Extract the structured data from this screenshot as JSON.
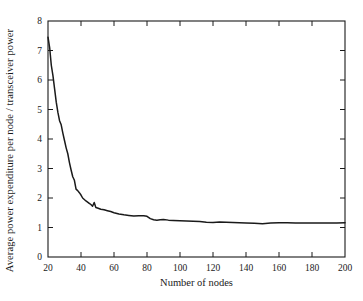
{
  "chart_data": {
    "type": "line",
    "title": "",
    "xlabel": "Number of nodes",
    "ylabel": "Average power expenditure per node / transceiver power",
    "xlim": [
      20,
      200
    ],
    "ylim": [
      0,
      8
    ],
    "xticks": [
      20,
      40,
      60,
      80,
      100,
      120,
      140,
      160,
      180,
      200
    ],
    "yticks": [
      0,
      1,
      2,
      3,
      4,
      5,
      6,
      7,
      8
    ],
    "grid": false,
    "legend": null,
    "frame": "box-all-sides-inward-ticks",
    "line_color": "#1a1a1a",
    "series": [
      {
        "name": "average power expenditure ratio",
        "x": [
          20,
          21,
          22,
          23,
          24,
          25,
          26,
          27,
          28,
          29,
          30,
          31,
          32,
          33,
          34,
          35,
          36,
          37,
          38,
          39,
          40,
          41,
          42,
          43,
          44,
          45,
          46,
          47,
          48,
          49,
          50,
          52,
          54,
          56,
          58,
          60,
          63,
          66,
          69,
          72,
          75,
          78,
          80,
          82,
          84,
          86,
          88,
          90,
          93,
          96,
          100,
          104,
          108,
          112,
          116,
          120,
          124,
          128,
          132,
          136,
          140,
          145,
          150,
          155,
          160,
          165,
          170,
          175,
          180,
          185,
          190,
          195,
          200
        ],
        "values": [
          7.45,
          7.1,
          6.5,
          6.15,
          5.7,
          5.25,
          4.9,
          4.62,
          4.48,
          4.2,
          3.95,
          3.7,
          3.5,
          3.2,
          2.95,
          2.72,
          2.6,
          2.3,
          2.25,
          2.18,
          2.1,
          2.0,
          1.95,
          1.9,
          1.86,
          1.82,
          1.78,
          1.72,
          1.85,
          1.68,
          1.66,
          1.62,
          1.6,
          1.57,
          1.54,
          1.5,
          1.46,
          1.43,
          1.41,
          1.39,
          1.4,
          1.4,
          1.38,
          1.3,
          1.26,
          1.25,
          1.26,
          1.27,
          1.25,
          1.24,
          1.23,
          1.22,
          1.21,
          1.2,
          1.18,
          1.17,
          1.19,
          1.18,
          1.17,
          1.16,
          1.15,
          1.14,
          1.13,
          1.15,
          1.16,
          1.16,
          1.15,
          1.15,
          1.15,
          1.15,
          1.15,
          1.15,
          1.16
        ]
      }
    ]
  },
  "axes": {
    "x_tick_labels": [
      "20",
      "40",
      "60",
      "80",
      "100",
      "120",
      "140",
      "160",
      "180",
      "200"
    ],
    "y_tick_labels": [
      "0",
      "1",
      "2",
      "3",
      "4",
      "5",
      "6",
      "7",
      "8"
    ],
    "x_title": "Number of nodes",
    "y_title": "Average power expenditure per node / transceiver power"
  }
}
